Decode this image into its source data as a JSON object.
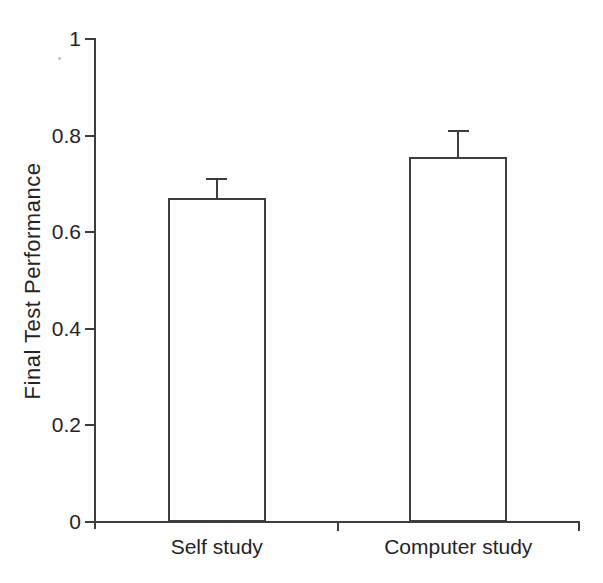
{
  "figure": {
    "background": "#ffffff",
    "line_color": "#3d3d3d",
    "text_color": "#242424",
    "bar_fill": "#ffffff"
  },
  "chart_data": {
    "type": "bar",
    "title": "",
    "xlabel": "",
    "ylabel": "Final Test Performance",
    "categories": [
      "Self study",
      "Computer study"
    ],
    "values": [
      0.67,
      0.755
    ],
    "errors_upper": [
      0.04,
      0.055
    ],
    "errors_lower": [
      0,
      0
    ],
    "ylim": [
      0,
      1
    ],
    "yticks": [
      0,
      0.2,
      0.4,
      0.6,
      0.8,
      1
    ],
    "ytick_labels": [
      "0",
      "0.2",
      "0.4",
      "0.6",
      "0.8",
      "1"
    ],
    "grid": false,
    "legend": "none",
    "bar_style": {
      "fill": "#ffffff",
      "stroke": "#3d3d3d",
      "error_caps": "upper-only"
    }
  }
}
